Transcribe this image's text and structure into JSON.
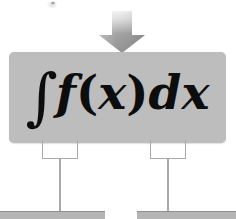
{
  "diagram": {
    "colors": {
      "box_fill": "#bdbdbd",
      "bottom_box_fill": "#b5b5b5",
      "connector_line": "#a9a9a9",
      "arrow_fill": "#9a9a9a",
      "formula_text": "#0d0d0d",
      "background": "#ffffff"
    },
    "arrow": {
      "name": "down-arrow",
      "direction": "down"
    },
    "main_box": {
      "formula": {
        "integral_sign": "∫",
        "function": "f",
        "open_paren": "(",
        "variable": "x",
        "close_paren": ")",
        "differential": "d",
        "differential_variable": "x",
        "full_text": "∫f(x)dx"
      }
    },
    "connectors": [
      {
        "name": "left-connector",
        "label": ""
      },
      {
        "name": "right-connector",
        "label": ""
      }
    ],
    "bottom_boxes": [
      {
        "name": "left-bottom-box",
        "label": ""
      },
      {
        "name": "right-bottom-box",
        "label": ""
      }
    ]
  }
}
